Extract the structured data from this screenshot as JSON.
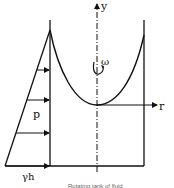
{
  "figure": {
    "type": "rotating-fluid-pressure-diagram",
    "labels": {
      "y_axis": "y",
      "r_axis": "r",
      "omega": "ω",
      "pressure": "p",
      "bottom_pressure": "γh"
    },
    "caption": "Rotating tank of fluid",
    "colors": {
      "line": "#111111",
      "background": "#ffffff"
    }
  }
}
